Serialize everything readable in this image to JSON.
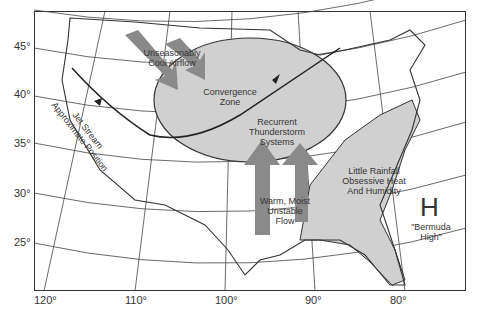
{
  "map": {
    "type": "annotated weather pattern map",
    "region": "Continental United States",
    "latitude_labels": [
      "45°",
      "40°",
      "35°",
      "30°",
      "25°"
    ],
    "longitude_labels": [
      "120°",
      "110°",
      "100°",
      "90°",
      "80°"
    ],
    "annotations": {
      "cool_airflow": "Unseasonably Cool Airflow",
      "cool_airflow_line1": "Unseasonably",
      "cool_airflow_line2": "Cool Airflow",
      "convergence_line1": "Convergence",
      "convergence_line2": "Zone",
      "thunder_line1": "Recurrent",
      "thunder_line2": "Thunderstorm",
      "thunder_line3": "Systems",
      "jet_line1": "Jet Stream",
      "jet_line2": "Approximate Position",
      "warm_line1": "Warm, Moist",
      "warm_line2": "Unstable",
      "warm_line3": "Flow",
      "rain_line1": "Little Rainfall",
      "rain_line2": "Obsessive Heat",
      "rain_line3": "And Humidity",
      "high_symbol": "H",
      "high_line1": "\"Bermuda",
      "high_line2": "High\""
    },
    "colors": {
      "shaded_region": "#d0d0d0",
      "arrow_fill": "#8a8a8a",
      "outline": "#333333"
    }
  }
}
